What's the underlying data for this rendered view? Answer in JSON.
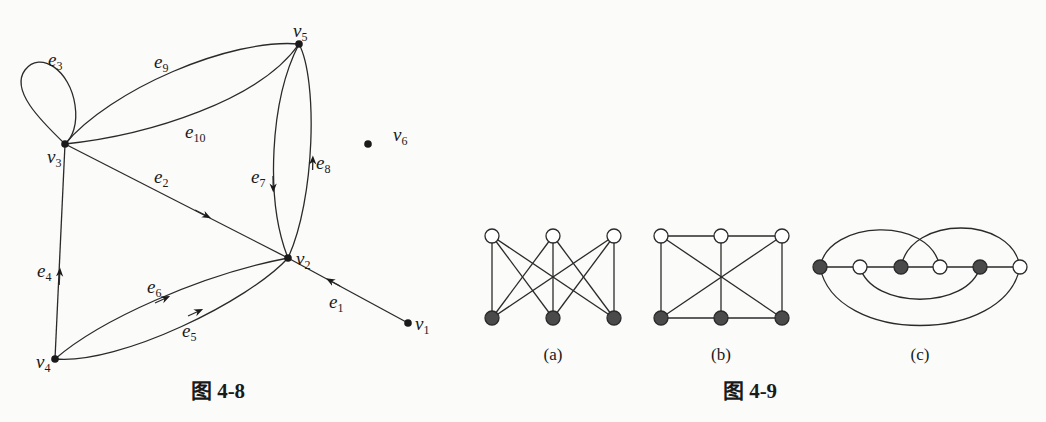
{
  "figure_4_8": {
    "caption": "图 4-8",
    "vertices": [
      {
        "id": "v1",
        "label": "v",
        "sub": "1",
        "x": 408,
        "y": 323
      },
      {
        "id": "v2",
        "label": "v",
        "sub": "2",
        "x": 288,
        "y": 258
      },
      {
        "id": "v3",
        "label": "v",
        "sub": "3",
        "x": 65,
        "y": 144
      },
      {
        "id": "v4",
        "label": "v",
        "sub": "4",
        "x": 55,
        "y": 359
      },
      {
        "id": "v5",
        "label": "v",
        "sub": "5",
        "x": 299,
        "y": 44
      },
      {
        "id": "v6",
        "label": "v",
        "sub": "6",
        "x": 368,
        "y": 144
      }
    ],
    "edges": [
      {
        "id": "e1",
        "label": "e",
        "sub": "1",
        "from": "v1",
        "to": "v2",
        "directed": true
      },
      {
        "id": "e2",
        "label": "e",
        "sub": "2",
        "from": "v3",
        "to": "v2",
        "directed": true
      },
      {
        "id": "e3",
        "label": "e",
        "sub": "3",
        "from": "v3",
        "to": "v3",
        "directed": false,
        "loop": true
      },
      {
        "id": "e4",
        "label": "e",
        "sub": "4",
        "from": "v4",
        "to": "v3",
        "directed": true
      },
      {
        "id": "e5",
        "label": "e",
        "sub": "5",
        "from": "v4",
        "to": "v2",
        "directed": true
      },
      {
        "id": "e6",
        "label": "e",
        "sub": "6",
        "from": "v4",
        "to": "v2",
        "directed": true
      },
      {
        "id": "e7",
        "label": "e",
        "sub": "7",
        "from": "v5",
        "to": "v2",
        "directed": true
      },
      {
        "id": "e8",
        "label": "e",
        "sub": "8",
        "from": "v2",
        "to": "v5",
        "directed": true
      },
      {
        "id": "e9",
        "label": "e",
        "sub": "9",
        "from": "v3",
        "to": "v5",
        "directed": false
      },
      {
        "id": "e10",
        "label": "e",
        "sub": "10",
        "from": "v3",
        "to": "v5",
        "directed": false
      }
    ]
  },
  "figure_4_9": {
    "caption": "图 4-9",
    "subfigures": [
      {
        "id": "a",
        "label": "(a)",
        "description": "K3,3 bipartite drawing: 3 white top nodes, 3 dark bottom nodes, every top connected to every bottom"
      },
      {
        "id": "b",
        "label": "(b)",
        "description": "3 white top nodes, 3 dark bottom nodes, rectangle with middle vertical and two diagonals"
      },
      {
        "id": "c",
        "label": "(c)",
        "description": "6 nodes on a line alternating dark/white with four arcs"
      }
    ]
  }
}
